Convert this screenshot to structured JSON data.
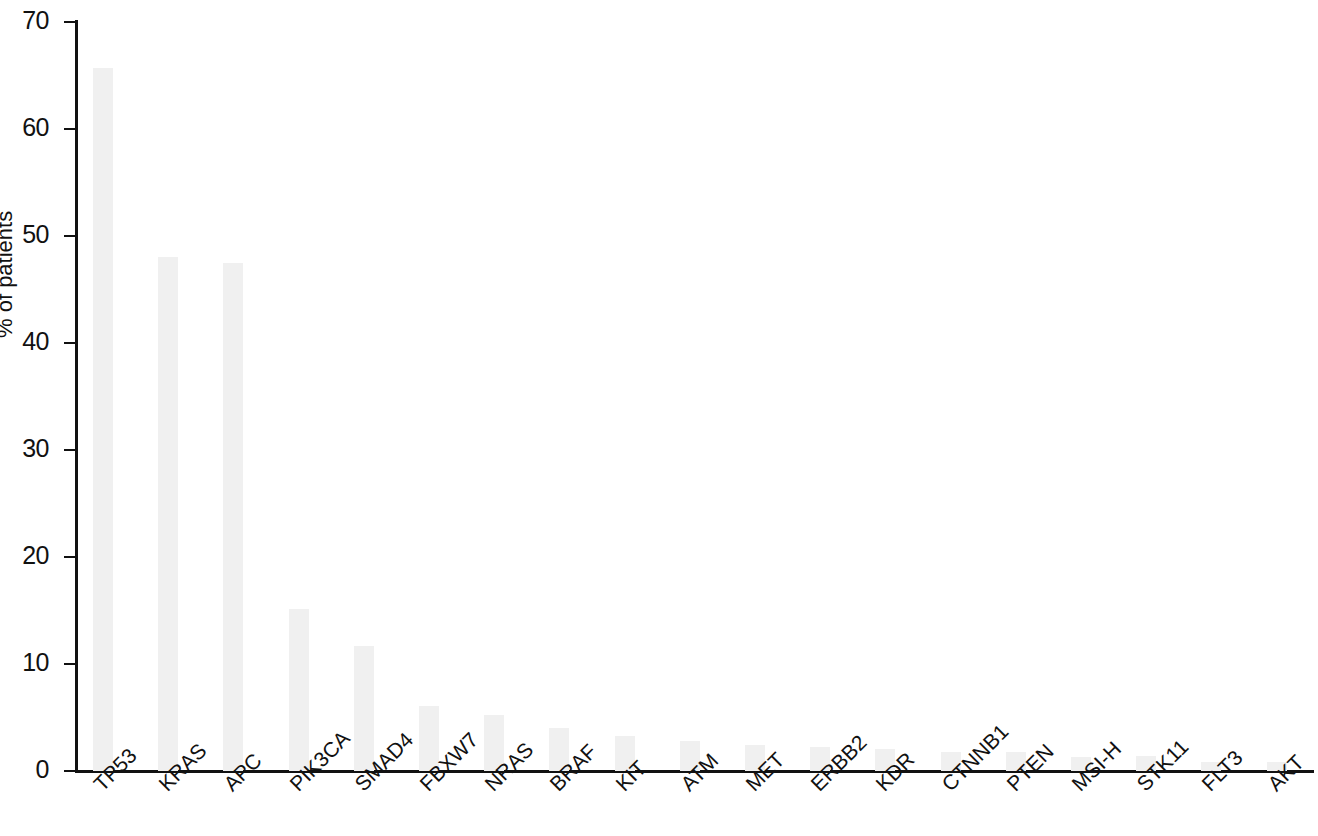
{
  "chart_data": {
    "type": "bar",
    "title": "",
    "subtitle": "",
    "xlabel": "",
    "ylabel": "% of patients",
    "ylim": [
      0,
      70
    ],
    "xlim_note": "categorical",
    "grid": false,
    "legend": null,
    "bar_color": "#f0f0f0",
    "axis_color": "#111111",
    "y_ticks": [
      0,
      10,
      20,
      30,
      40,
      50,
      60,
      70
    ],
    "y_tick_labels": [
      "0",
      "10",
      "20",
      "30",
      "40",
      "50",
      "60",
      "70"
    ],
    "categories": [
      "TP53",
      "KRAS",
      "APC",
      "PIK3CA",
      "SMAD4",
      "FBXW7",
      "NRAS",
      "BRAF",
      "KIT",
      "ATM",
      "MET",
      "ERBB2",
      "KDR",
      "CTNNB1",
      "PTEN",
      "MSI-H",
      "STK11",
      "FLT3",
      "AKT"
    ],
    "values": [
      65.7,
      48.0,
      47.5,
      15.1,
      11.7,
      6.1,
      5.2,
      4.0,
      3.3,
      2.8,
      2.4,
      2.2,
      2.1,
      1.8,
      1.8,
      1.3,
      1.4,
      0.8,
      0.8
    ]
  }
}
